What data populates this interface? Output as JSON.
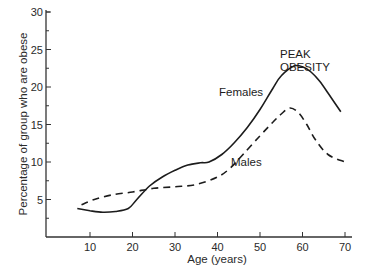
{
  "chart_data": {
    "type": "line",
    "title": "",
    "xlabel": "Age (years)",
    "ylabel": "Percentage of group who are obese",
    "xlim": [
      0,
      72
    ],
    "ylim": [
      0,
      30
    ],
    "x_ticks": [
      10,
      20,
      30,
      40,
      50,
      60,
      70
    ],
    "y_ticks": [
      5,
      10,
      15,
      20,
      25,
      30
    ],
    "grid": false,
    "legend": "inline labels",
    "annotations": [
      {
        "text": "PEAK",
        "x": 58,
        "y": 26.5
      },
      {
        "text": "OBESITY",
        "x": 58,
        "y": 24.8
      }
    ],
    "series": [
      {
        "name": "Females",
        "style": "solid",
        "x": [
          7,
          10,
          13,
          16,
          19,
          21,
          24,
          27,
          30,
          33,
          36,
          38,
          41,
          44,
          47,
          50,
          53,
          55,
          58,
          60,
          62,
          64,
          66,
          69
        ],
        "y": [
          3.8,
          3.5,
          3.3,
          3.4,
          3.8,
          5.0,
          6.8,
          8.0,
          8.9,
          9.6,
          9.9,
          10.0,
          11.0,
          12.6,
          14.6,
          17.0,
          19.8,
          21.5,
          22.8,
          22.7,
          22.0,
          20.8,
          19.2,
          16.7
        ]
      },
      {
        "name": "Males",
        "style": "dashed",
        "x": [
          8,
          11,
          15,
          20,
          25,
          30,
          35,
          40,
          43,
          46,
          50,
          53,
          55,
          57,
          59,
          61,
          63,
          66,
          70
        ],
        "y": [
          4.3,
          5.0,
          5.6,
          6.0,
          6.5,
          6.7,
          7.0,
          8.0,
          9.2,
          11.0,
          13.5,
          15.3,
          16.4,
          17.2,
          16.6,
          15.0,
          13.0,
          11.0,
          10.0
        ]
      }
    ]
  },
  "labels": {
    "females": "Females",
    "males": "Males",
    "peak_line1": "PEAK",
    "peak_line2": "OBESITY",
    "xlabel": "Age (years)",
    "ylabel": "Percentage of group who are obese"
  }
}
